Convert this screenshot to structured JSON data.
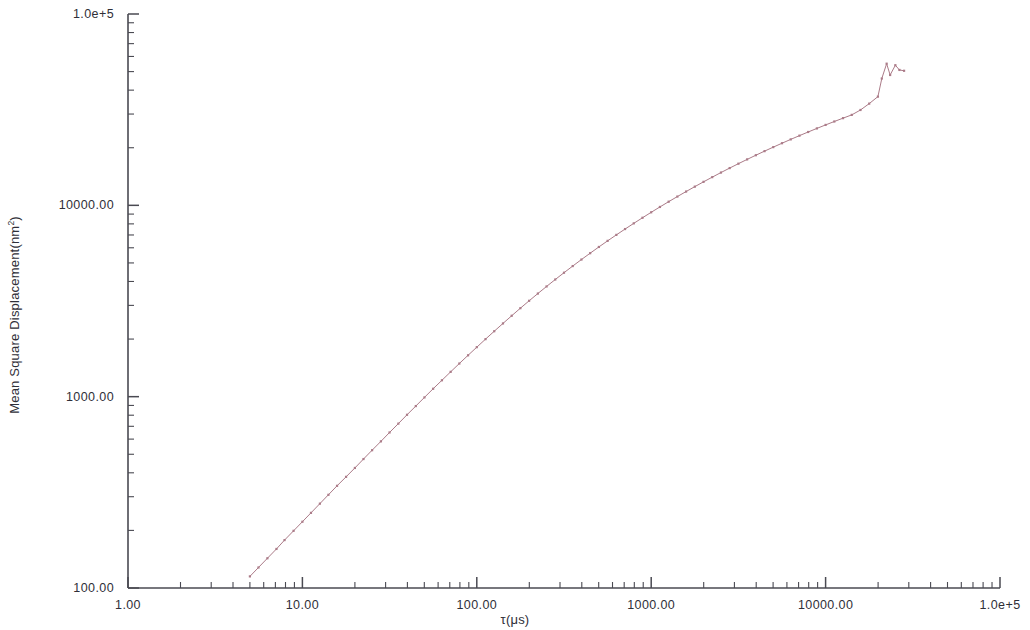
{
  "chart_data": {
    "type": "line",
    "title": "",
    "xlabel": "τ(μs)",
    "ylabel_text": "Mean Square Displacement(nm",
    "ylabel_sup": "2",
    "ylabel_tail": ")",
    "xscale": "log",
    "yscale": "log",
    "xlim": [
      1,
      100000
    ],
    "ylim": [
      100,
      100000
    ],
    "grid": false,
    "legend": null,
    "xticklabels": [
      "1.00",
      "10.00",
      "100.00",
      "1000.00",
      "10000.00",
      "1.0e+5"
    ],
    "xtickvalues": [
      1,
      10,
      100,
      1000,
      10000,
      100000
    ],
    "yticklabels": [
      "100.00",
      "1000.00",
      "10000.00",
      "1.0e+5"
    ],
    "ytickvalues": [
      100,
      1000,
      10000,
      100000
    ],
    "series": [
      {
        "name": "Mean Square Displacement",
        "color": "#ab7b88",
        "marker": "small-dot",
        "linewidth": 1,
        "x": [
          5.0,
          5.6,
          6.3,
          7.1,
          7.9,
          8.9,
          10.0,
          11.2,
          12.6,
          14.1,
          15.8,
          17.8,
          20.0,
          22.4,
          25.1,
          28.2,
          31.6,
          35.5,
          39.8,
          44.7,
          50.1,
          56.2,
          63.1,
          70.8,
          79.4,
          89.1,
          100.0,
          112.2,
          125.9,
          141.3,
          158.5,
          177.8,
          199.5,
          223.9,
          251.2,
          281.8,
          316.2,
          354.8,
          398.1,
          446.7,
          501.2,
          562.3,
          631.0,
          708.0,
          794.3,
          891.3,
          1000.0,
          1122.0,
          1258.9,
          1412.5,
          1584.9,
          1778.3,
          1995.3,
          2238.7,
          2511.9,
          2818.4,
          3162.3,
          3548.1,
          3981.1,
          4466.8,
          5011.9,
          5623.4,
          6309.6,
          7079.5,
          7943.3,
          8912.5,
          10000.0,
          11220.2,
          12589.3,
          14125.4,
          15848.9,
          17782.8,
          19952.6,
          21000.0,
          22387.2,
          23442.0,
          25118.9,
          26500.0,
          28183.8
        ],
        "y": [
          115,
          128,
          143,
          160,
          178,
          199,
          222,
          247,
          276,
          307,
          342,
          381,
          424,
          472,
          525,
          584,
          650,
          723,
          804,
          893,
          991,
          1100,
          1218,
          1348,
          1490,
          1645,
          1814,
          1998,
          2198,
          2414,
          2648,
          2900,
          3170,
          3459,
          3767,
          4096,
          4445,
          4815,
          5208,
          5622,
          6060,
          6521,
          7006,
          7516,
          8050,
          8610,
          9196,
          9808,
          10447,
          11112,
          11804,
          12522,
          13267,
          14038,
          14835,
          15658,
          16506,
          17379,
          18277,
          19200,
          20147,
          21118,
          22113,
          23131,
          24172,
          25235,
          26320,
          27426,
          28553,
          29700,
          31500,
          34000,
          37000,
          46000,
          55000,
          48000,
          54000,
          51000,
          50500
        ]
      }
    ],
    "annotations": []
  },
  "axes": {
    "line_color": "#4a4a52",
    "tick_color": "#4a4a52",
    "plot_left": 128,
    "plot_right": 1000,
    "plot_top": 14,
    "plot_bottom": 588
  }
}
